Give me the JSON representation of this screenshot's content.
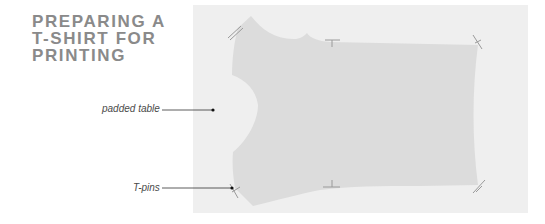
{
  "title": {
    "lines": [
      "PREPARING A",
      "T-SHIRT FOR",
      "PRINTING"
    ]
  },
  "labels": {
    "padded_table": "padded table",
    "t_pins": "T-pins"
  },
  "colors": {
    "title": "#8a8a8a",
    "table": "#efefef",
    "shirt": "#dcdcdc",
    "leader_line": "#333333",
    "pin": "#9a9a9a"
  }
}
